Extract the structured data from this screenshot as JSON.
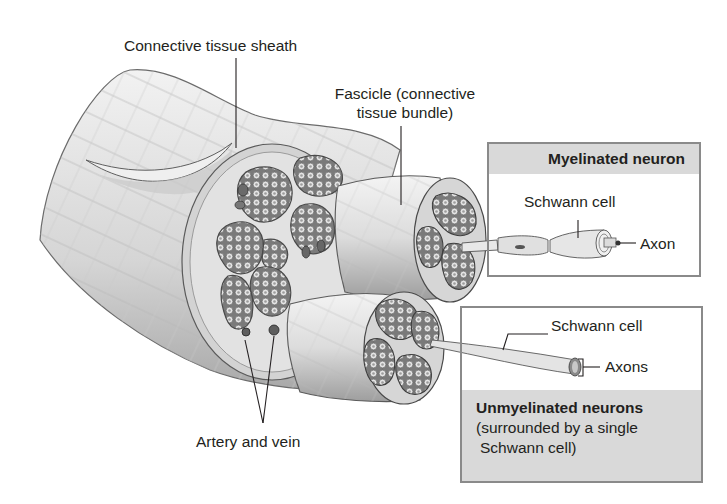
{
  "diagram": {
    "labels": {
      "connective_tissue_sheath": "Connective tissue sheath",
      "fascicle_line1": "Fascicle (connective",
      "fascicle_line2": "tissue bundle)",
      "artery_and_vein": "Artery and vein"
    },
    "myelinated_box": {
      "heading": "Myelinated neuron",
      "schwann_cell": "Schwann cell",
      "axon": "Axon"
    },
    "unmyelinated_box": {
      "heading": "Unmyelinated neurons",
      "desc_line1": "(surrounded by a single",
      "desc_line2": "Schwann cell)",
      "schwann_cell": "Schwann cell",
      "axons": "Axons"
    },
    "colors": {
      "box_header_fill": "#d9d9d9",
      "box_border": "#8a8a8a",
      "text": "#231f20",
      "tissue_light": "#e6e6e6",
      "tissue_mid": "#bdbdbd",
      "tissue_dark": "#6e6e6e"
    }
  }
}
